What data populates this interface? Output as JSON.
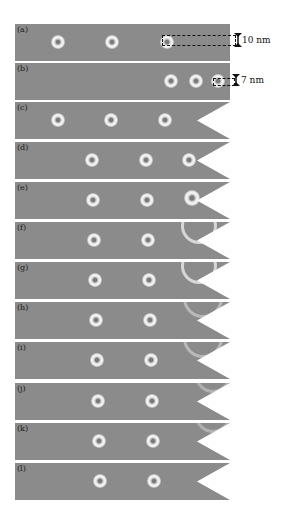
{
  "figure": {
    "panels": [
      {
        "label": "(a)",
        "top": 24,
        "skyrmions": [
          43,
          97,
          152
        ],
        "notch": false,
        "annotation": "10 nm"
      },
      {
        "label": "(b)",
        "top": 63,
        "skyrmions": [
          156,
          181,
          203
        ],
        "notch": false,
        "annotation": "7 nm"
      },
      {
        "label": "(c)",
        "top": 102,
        "skyrmions": [
          43,
          96,
          150
        ],
        "notch": true
      },
      {
        "label": "(d)",
        "top": 142,
        "skyrmions": [
          77,
          131,
          174
        ],
        "notch": true
      },
      {
        "label": "(e)",
        "top": 182,
        "skyrmions": [
          78,
          132
        ],
        "deformed": "entering-notch",
        "notch": true
      },
      {
        "label": "(f)",
        "top": 222,
        "skyrmions": [
          79,
          133
        ],
        "deformed": "arc",
        "notch": true
      },
      {
        "label": "(g)",
        "top": 262,
        "skyrmions": [
          80,
          134
        ],
        "deformed": "arc",
        "notch": true
      },
      {
        "label": "(h)",
        "top": 302,
        "skyrmions": [
          81,
          135
        ],
        "deformed": "faint-arc",
        "notch": true
      },
      {
        "label": "(i)",
        "top": 342,
        "skyrmions": [
          82,
          136
        ],
        "deformed": "faint-arc",
        "notch": true
      },
      {
        "label": "(j)",
        "top": 383,
        "skyrmions": [
          83,
          137
        ],
        "deformed": "faint-edge",
        "notch": true
      },
      {
        "label": "(k)",
        "top": 423,
        "skyrmions": [
          84,
          138
        ],
        "deformed": "faint-edge",
        "notch": true
      },
      {
        "label": "(l)",
        "top": 463,
        "skyrmions": [
          85,
          139
        ],
        "notch": true
      }
    ],
    "annotations": {
      "a": "10 nm",
      "b": "7 nm"
    },
    "colors": {
      "background": "#8b8b8b",
      "skyrmion": "#f6f6f6",
      "notch": "#ffffff"
    }
  }
}
